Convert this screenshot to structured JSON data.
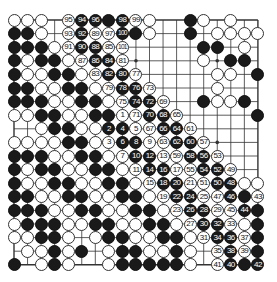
{
  "diagram": {
    "type": "go-board",
    "size": 19,
    "colors": {
      "black": "#1a1a1a",
      "white": "#ffffff",
      "line": "#333333",
      "background": "#ffffff"
    },
    "star_points": [
      [
        3,
        3
      ],
      [
        3,
        9
      ],
      [
        3,
        15
      ],
      [
        9,
        3
      ],
      [
        9,
        9
      ],
      [
        9,
        15
      ],
      [
        15,
        3
      ],
      [
        15,
        9
      ],
      [
        15,
        15
      ]
    ],
    "legend": "Cells: '' empty, 'B' black, 'W' white, numbers = move numbers (odd = white, even = black)",
    "rows": [
      [
        "W",
        "W",
        "W",
        "",
        "95",
        "94",
        "96",
        "B",
        "98",
        "99",
        "W",
        "",
        "",
        "B",
        "W",
        "",
        "W",
        "",
        ""
      ],
      [
        "B",
        "B",
        "W",
        "",
        "93",
        "92",
        "89",
        "97",
        "100",
        "B",
        "W",
        "",
        "",
        "B",
        "",
        "W",
        "W",
        "W",
        "W"
      ],
      [
        "B",
        "B",
        "B",
        "W",
        "91",
        "90",
        "88",
        "85",
        "101",
        "",
        "",
        "",
        "",
        "",
        "B",
        "B",
        "",
        "W",
        ""
      ],
      [
        "B",
        "W",
        "B",
        "B",
        "W",
        "87",
        "86",
        "84",
        "81",
        "",
        "",
        "",
        "",
        "",
        "W",
        "",
        "B",
        "B",
        ""
      ],
      [
        "B",
        "W",
        "W",
        "B",
        "B",
        "W",
        "83",
        "82",
        "80",
        "77",
        "",
        "",
        "",
        "",
        "",
        "W",
        "W",
        "",
        "B"
      ],
      [
        "B",
        "B",
        "W",
        "W",
        "B",
        "B",
        "W",
        "79",
        "78",
        "76",
        "73",
        "",
        "",
        "",
        "",
        "W",
        "",
        "",
        ""
      ],
      [
        "B",
        "B",
        "B",
        "W",
        "W",
        "B",
        "B",
        "W",
        "75",
        "74",
        "72",
        "69",
        "",
        "",
        "B",
        "W",
        "W",
        "B",
        ""
      ],
      [
        "W",
        "W",
        "B",
        "B",
        "W",
        "W",
        "B",
        "B",
        "1",
        "71",
        "70",
        "68",
        "65",
        "",
        "",
        "",
        "",
        "",
        "B"
      ],
      [
        "",
        "",
        "W",
        "B",
        "B",
        "W",
        "W",
        "2",
        "4",
        "5",
        "67",
        "66",
        "64",
        "61",
        "",
        "",
        "",
        "",
        ""
      ],
      [
        "W",
        "W",
        "W",
        "W",
        "B",
        "B",
        "W",
        "3",
        "6",
        "8",
        "9",
        "63",
        "62",
        "60",
        "57",
        "",
        "",
        "",
        ""
      ],
      [
        "B",
        "B",
        "B",
        "W",
        "W",
        "B",
        "B",
        "W",
        "7",
        "10",
        "12",
        "13",
        "59",
        "58",
        "56",
        "53",
        "",
        "",
        ""
      ],
      [
        "B",
        "W",
        "B",
        "B",
        "W",
        "W",
        "B",
        "B",
        "W",
        "11",
        "14",
        "16",
        "17",
        "55",
        "54",
        "52",
        "49",
        "",
        ""
      ],
      [
        "B",
        "W",
        "W",
        "B",
        "B",
        "W",
        "W",
        "B",
        "B",
        "W",
        "15",
        "18",
        "20",
        "21",
        "51",
        "50",
        "48",
        "W",
        "W"
      ],
      [
        "B",
        "B",
        "W",
        "W",
        "B",
        "B",
        "W",
        "W",
        "B",
        "B",
        "W",
        "19",
        "22",
        "24",
        "25",
        "47",
        "46",
        "B",
        "43"
      ],
      [
        "B",
        "B",
        "B",
        "W",
        "W",
        "B",
        "B",
        "W",
        "W",
        "B",
        "B",
        "W",
        "23",
        "26",
        "28",
        "29",
        "45",
        "44",
        "B"
      ],
      [
        "W",
        "B",
        "B",
        "B",
        "W",
        "W",
        "B",
        "B",
        "W",
        "W",
        "B",
        "B",
        "W",
        "27",
        "30",
        "32",
        "33",
        "W",
        "B"
      ],
      [
        "W",
        "W",
        "B",
        "B",
        "W",
        "",
        "W",
        "B",
        "B",
        "W",
        "W",
        "B",
        "B",
        "W",
        "31",
        "34",
        "36",
        "37",
        "B"
      ],
      [
        "",
        "W",
        "W",
        "B",
        "W",
        "B",
        "",
        "W",
        "B",
        "B",
        "W",
        "W",
        "B",
        "W",
        "",
        "35",
        "38",
        "39",
        "B"
      ],
      [
        "B",
        "",
        "W",
        "B",
        "W",
        "",
        "",
        "W",
        "B",
        "B",
        "B",
        "B",
        "B",
        "W",
        "",
        "41",
        "40",
        "B",
        "42"
      ]
    ]
  }
}
